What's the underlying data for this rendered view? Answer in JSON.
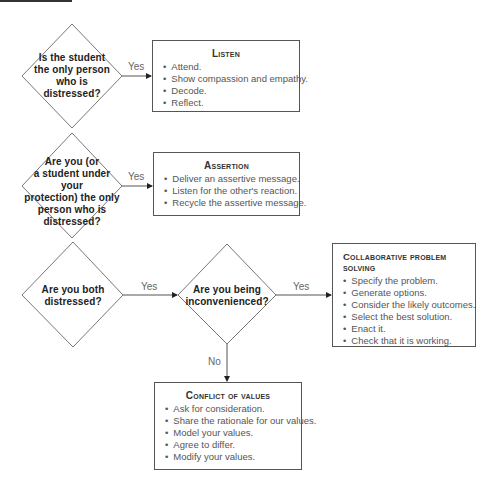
{
  "diagram": {
    "decisions": [
      {
        "id": "d1",
        "text_lines": [
          "Is the student",
          "the only person",
          "who is",
          "distressed?"
        ]
      },
      {
        "id": "d2",
        "text_lines": [
          "Are you (or",
          "a student under your",
          "protection) the only",
          "person who is",
          "distressed?"
        ]
      },
      {
        "id": "d3",
        "text_lines": [
          "Are you both",
          "distressed?"
        ]
      },
      {
        "id": "d4",
        "text_lines": [
          "Are you being",
          "inconvenienced?"
        ]
      }
    ],
    "edges": [
      {
        "from": "d1",
        "to": "listen",
        "label": "Yes"
      },
      {
        "from": "d2",
        "to": "assertion",
        "label": "Yes"
      },
      {
        "from": "d3",
        "to": "d4",
        "label": "Yes"
      },
      {
        "from": "d4",
        "to": "collab",
        "label": "Yes"
      },
      {
        "from": "d4",
        "to": "conflict",
        "label": "No"
      }
    ],
    "boxes": {
      "listen": {
        "title": "Listen",
        "items": [
          "Attend.",
          "Show compassion and empathy.",
          "Decode.",
          "Reflect."
        ]
      },
      "assertion": {
        "title": "Assertion",
        "items": [
          "Deliver an assertive message.",
          "Listen for the other's reaction.",
          "Recycle the assertive message."
        ]
      },
      "collab": {
        "title": "Collaborative problem solving",
        "items": [
          "Specify the problem.",
          "Generate options.",
          "Consider the likely outcomes.",
          "Select the best solution.",
          "Enact it.",
          "Check that it is working."
        ]
      },
      "conflict": {
        "title": "Conflict of values",
        "items": [
          "Ask for consideration.",
          "Share the rationale for our values.",
          "Model your values.",
          "Agree to differ.",
          "Modify your values."
        ]
      }
    },
    "colors": {
      "line": "#555555",
      "text_dark": "#222222",
      "text_light": "#555555",
      "label": "#666666"
    }
  }
}
